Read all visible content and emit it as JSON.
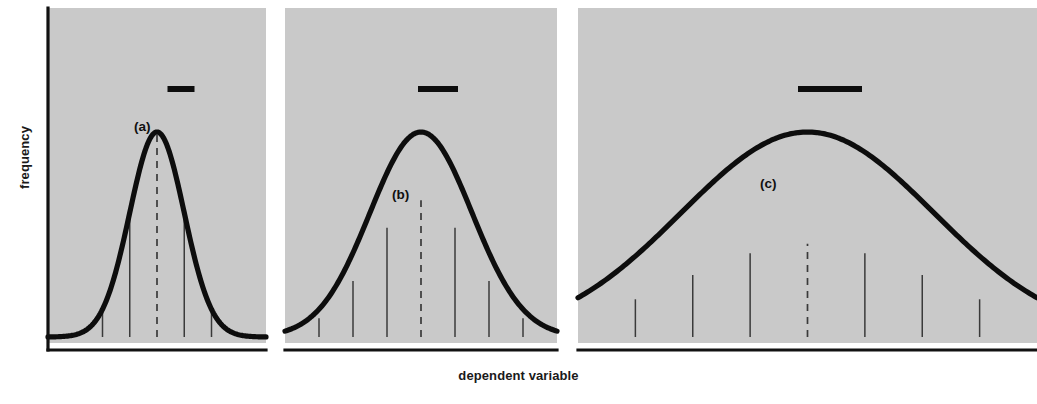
{
  "figure": {
    "axes": {
      "ylabel": "frequency",
      "xlabel": "dependent variable"
    }
  },
  "chart_data": {
    "type": "line",
    "title": "",
    "subtitle": "",
    "xlabel": "dependent variable",
    "ylabel": "frequency",
    "grid": false,
    "legend": "none",
    "panel_count": 3,
    "axis_tick_labels": [],
    "xlim": [
      -4,
      4
    ],
    "ylim": [
      0,
      1
    ],
    "panels": [
      {
        "label": "(a)",
        "name": "narrow-distribution",
        "sigma": 1.0,
        "mean": 0,
        "peak_height": 1.0,
        "spread_bar_length": 27,
        "relative_width": "narrow",
        "ordinate_offsets": [
          -3,
          -2,
          -1,
          0,
          1,
          2,
          3
        ],
        "ordinate_heights": [
          0.011,
          0.135,
          0.607,
          1.0,
          0.607,
          0.135,
          0.011
        ],
        "mean_line_style": "dashed"
      },
      {
        "label": "(b)",
        "name": "medium-distribution",
        "sigma": 1.5,
        "mean": 0,
        "peak_height": 0.667,
        "spread_bar_length": 40,
        "relative_width": "medium",
        "ordinate_offsets": [
          -3,
          -2,
          -1,
          0,
          1,
          2,
          3
        ],
        "ordinate_heights": [
          0.091,
          0.273,
          0.533,
          0.667,
          0.533,
          0.273,
          0.091
        ],
        "mean_line_style": "dashed"
      },
      {
        "label": "(c)",
        "name": "wide-distribution",
        "sigma": 2.2,
        "mean": 0,
        "peak_height": 0.455,
        "spread_bar_length": 64,
        "relative_width": "wide",
        "ordinate_offsets": [
          -3,
          -2,
          -1,
          0,
          1,
          2,
          3
        ],
        "ordinate_heights": [
          0.184,
          0.303,
          0.409,
          0.455,
          0.409,
          0.303,
          0.184
        ],
        "mean_line_style": "dashed"
      }
    ],
    "colors": {
      "panel_background": "#c9c9c9",
      "curve": "#0d0d0d",
      "axis": "#111111",
      "ordinate": "#3a3a3a",
      "page_background": "#ffffff"
    }
  }
}
